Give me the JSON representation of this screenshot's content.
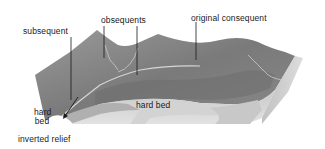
{
  "diagram": {
    "type": "block-diagram",
    "labels": {
      "subsequent": "subsequent",
      "obsequents": "obsequents",
      "original_consequent": "original consequent",
      "hard_bed_center": "hard bed",
      "hard_bed_left_line1": "hard",
      "hard_bed_left_line2": "bed",
      "inverted_relief": "inverted relief"
    },
    "colors": {
      "background": "#ffffff",
      "surface_dark": "#6e6e6e",
      "surface_mid": "#8a8a8a",
      "surface_light": "#a5a5a5",
      "strata_light": "#d8d8d8",
      "strata_mid": "#bdbdbd",
      "strata_dark": "#9a9a9a",
      "river": "#cfcfcf",
      "text": "#1a1a1a"
    }
  }
}
